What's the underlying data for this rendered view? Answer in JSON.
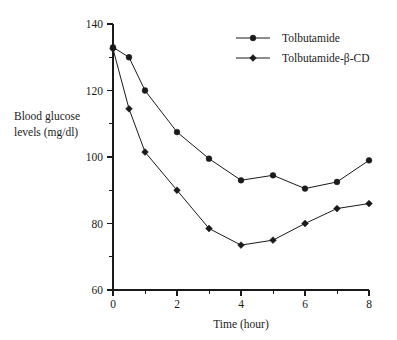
{
  "chart_data": {
    "type": "line",
    "title": "",
    "xlabel": "Time (hour)",
    "ylabel": "Blood glucose levels (mg/dl)",
    "ylabel_line1": "Blood glucose",
    "ylabel_line2": "levels (mg/dl)",
    "x": [
      0,
      0.5,
      1,
      2,
      3,
      4,
      5,
      6,
      7,
      8
    ],
    "xlim": [
      0,
      8
    ],
    "ylim": [
      60,
      140
    ],
    "xticks": [
      0,
      2,
      4,
      6,
      8
    ],
    "xtick_labels": [
      "0",
      "2",
      "4",
      "6",
      "8"
    ],
    "xticks_minor": [
      1,
      3,
      5,
      7
    ],
    "yticks": [
      60,
      80,
      100,
      120,
      140
    ],
    "ytick_labels": [
      "60",
      "80",
      "100",
      "120",
      "140"
    ],
    "yticks_minor": [
      70,
      90,
      110,
      130
    ],
    "grid": false,
    "legend_position": "top-right",
    "series": [
      {
        "name": "Tolbutamide",
        "marker": "circle",
        "color": "#1a1a1a",
        "values": [
          133,
          130,
          120,
          107.5,
          99.5,
          93,
          94.5,
          90.5,
          92.5,
          99
        ]
      },
      {
        "name": "Tolbutamide-β-CD",
        "marker": "diamond",
        "color": "#1a1a1a",
        "values": [
          132.5,
          114.5,
          101.5,
          90,
          78.5,
          73.5,
          75,
          80,
          84.5,
          86
        ]
      }
    ]
  }
}
